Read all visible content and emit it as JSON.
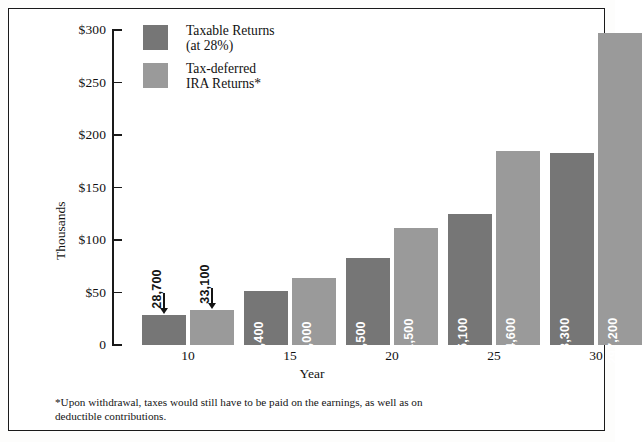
{
  "figure": {
    "y_axis_title": "Thousands",
    "x_axis_title": "Year"
  },
  "legend": {
    "items": [
      {
        "key": "taxable",
        "line1": "Taxable Returns",
        "line2": "(at 28%)",
        "color": "#767676"
      },
      {
        "key": "ira",
        "line1": "Tax-deferred",
        "line2": "IRA Returns*",
        "color": "#9a9a9a"
      }
    ]
  },
  "footnote": {
    "line1": "*Upon withdrawal, taxes would still have to be paid on the earnings, as well as on",
    "line2": "deductible contributions."
  },
  "chart_data": {
    "type": "bar",
    "title": "",
    "xlabel": "Year",
    "ylabel": "Thousands",
    "ylim": [
      0,
      300000
    ],
    "ytick_values": [
      0,
      50000,
      100000,
      150000,
      200000,
      250000,
      300000
    ],
    "ytick_labels": [
      "0",
      "$50",
      "$100",
      "$150",
      "$200",
      "$250",
      "$300"
    ],
    "categories": [
      "10",
      "15",
      "20",
      "25",
      "30"
    ],
    "xtick_labels": [
      "10",
      "15",
      "20",
      "25",
      "30"
    ],
    "grid": false,
    "legend_position": "top-left-inside",
    "series": [
      {
        "name": "Taxable Returns (at 28%)",
        "color": "#767676",
        "values": [
          28700,
          51400,
          82500,
          125100,
          183300
        ],
        "value_labels": [
          "28,700",
          "51,400",
          "82,500",
          "125,100",
          "183,300"
        ]
      },
      {
        "name": "Tax-deferred IRA Returns*",
        "color": "#9a9a9a",
        "values": [
          33100,
          64000,
          111500,
          184600,
          297200
        ],
        "value_labels": [
          "33,100",
          "64,000",
          "111,500",
          "184,600",
          "297,200"
        ]
      }
    ],
    "bars": [
      {
        "id": "b1",
        "series": "taxable",
        "year": "10",
        "value": 28700,
        "label": "28,700",
        "label_placement": "above-with-arrow"
      },
      {
        "id": "b2",
        "series": "ira",
        "year": "10",
        "value": 33100,
        "label": "33,100",
        "label_placement": "above-with-arrow"
      },
      {
        "id": "b3",
        "series": "taxable",
        "year": "15",
        "value": 51400,
        "label": "51,400",
        "label_placement": "inside"
      },
      {
        "id": "b4",
        "series": "ira",
        "year": "15",
        "value": 64000,
        "label": "64,000",
        "label_placement": "inside"
      },
      {
        "id": "b5",
        "series": "taxable",
        "year": "20",
        "value": 82500,
        "label": "82,500",
        "label_placement": "inside"
      },
      {
        "id": "b6",
        "series": "ira",
        "year": "20",
        "value": 111500,
        "label": "111,500",
        "label_placement": "inside"
      },
      {
        "id": "b7",
        "series": "taxable",
        "year": "25",
        "value": 125100,
        "label": "125,100",
        "label_placement": "inside"
      },
      {
        "id": "b8",
        "series": "ira",
        "year": "25",
        "value": 184600,
        "label": "184,600",
        "label_placement": "inside"
      },
      {
        "id": "b9",
        "series": "taxable",
        "year": "30",
        "value": 183300,
        "label": "183,300",
        "label_placement": "inside"
      },
      {
        "id": "b10",
        "series": "ira",
        "year": "30",
        "value": 297200,
        "label": "297,200",
        "label_placement": "inside"
      }
    ]
  }
}
